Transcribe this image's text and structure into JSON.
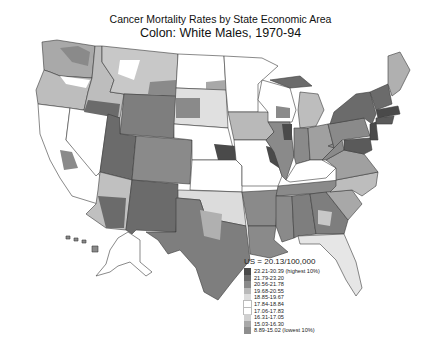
{
  "title": {
    "line1": "Cancer Mortality Rates by State Economic Area",
    "line2": "Colon:  White Males, 1970-94"
  },
  "legend": {
    "title": "US = 20.13/100,000",
    "items": [
      {
        "label": "23.21-30.39 (highest 10%)",
        "color": "#4a4a4a"
      },
      {
        "label": "21.79-23.20",
        "color": "#6b6b6b"
      },
      {
        "label": "20.56-21.78",
        "color": "#8a8a8a"
      },
      {
        "label": "19.68-20.55",
        "color": "#b9b9b9"
      },
      {
        "label": "18.85-19.67",
        "color": "#dcdcdc"
      },
      {
        "label": "17.84-18.84",
        "color": "#ffffff"
      },
      {
        "label": "17.06-17.83",
        "color": "#ffffff"
      },
      {
        "label": "16.31-17.05",
        "color": "#d0d0d0"
      },
      {
        "label": "15.03-16.30",
        "color": "#a8a8a8"
      },
      {
        "label": "8.89-15.02 (lowest 10%)",
        "color": "#8e8e8e"
      }
    ]
  },
  "map": {
    "type": "choropleth",
    "region": "United States (State Economic Areas)",
    "scale": "grayscale",
    "border_color": "#333333"
  }
}
